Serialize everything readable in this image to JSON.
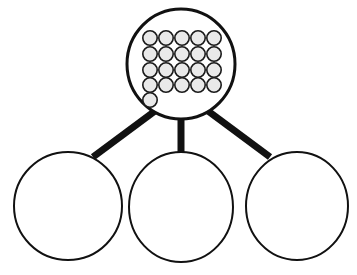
{
  "diagram": {
    "type": "part-whole-grouping-diagram",
    "background_color": "#ffffff",
    "stroke_color": "#111111",
    "connector_color": "#111111",
    "dot_fill_color": "#e9e9e9",
    "dot_stroke_color": "#1a1a1a",
    "parent_node": {
      "name": "whole-group",
      "shape": "ellipse",
      "center_x": 181,
      "center_y": 64,
      "radius_x": 54,
      "radius_y": 55,
      "stroke_width": 3,
      "fill": "#ffffff",
      "total_count": 21,
      "dot_radius": 7.2,
      "dot_grid": {
        "rows": [
          {
            "count": 5,
            "cy": 38,
            "start_cx": 150,
            "spacing": 16
          },
          {
            "count": 5,
            "cy": 54,
            "start_cx": 150,
            "spacing": 16
          },
          {
            "count": 5,
            "cy": 70,
            "start_cx": 150,
            "spacing": 16
          },
          {
            "count": 5,
            "cy": 85,
            "start_cx": 150,
            "spacing": 16
          },
          {
            "count": 1,
            "cy": 100,
            "start_cx": 150,
            "spacing": 16
          }
        ]
      }
    },
    "connectors": [
      {
        "name": "connector-left",
        "x1": 159,
        "y1": 108,
        "x2": 93,
        "y2": 157,
        "width": 7
      },
      {
        "name": "connector-middle",
        "x1": 181,
        "y1": 114,
        "x2": 181,
        "y2": 156,
        "width": 7
      },
      {
        "name": "connector-right",
        "x1": 204,
        "y1": 108,
        "x2": 270,
        "y2": 157,
        "width": 7
      }
    ],
    "child_nodes": [
      {
        "name": "group-part-left",
        "shape": "circle",
        "center_x": 68,
        "center_y": 206,
        "radius_x": 54,
        "radius_y": 54,
        "stroke_width": 2,
        "fill": "#ffffff",
        "total_count": 0
      },
      {
        "name": "group-part-middle",
        "shape": "circle",
        "center_x": 181,
        "center_y": 207,
        "radius_x": 52,
        "radius_y": 55,
        "stroke_width": 2,
        "fill": "#ffffff",
        "total_count": 0
      },
      {
        "name": "group-part-right",
        "shape": "circle",
        "center_x": 297,
        "center_y": 206,
        "radius_x": 51,
        "radius_y": 54,
        "stroke_width": 2,
        "fill": "#ffffff",
        "total_count": 0
      }
    ]
  }
}
